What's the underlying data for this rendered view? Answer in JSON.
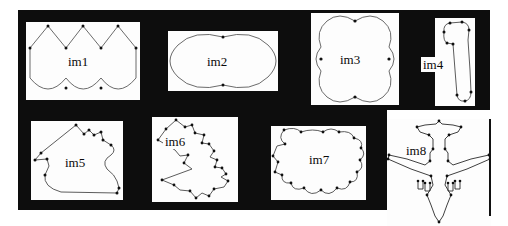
{
  "figure": {
    "kind": "shape-silhouette-grid",
    "background_color": "#ffffff",
    "backdrop_color": "#0d0d0d",
    "panel_color": "#fdfdfd",
    "outline_color": "#4a4a4a",
    "marker_color": "#101010",
    "rows": 2,
    "columns": 4,
    "item_count": 8
  },
  "panels": [
    {
      "id": "im1",
      "label": "im1",
      "shape_name": "three-lobe-scalloped-rectangle",
      "row": 1,
      "column": 1,
      "vertex_count": 10
    },
    {
      "id": "im2",
      "label": "im2",
      "shape_name": "two-lobe-peanut",
      "row": 1,
      "column": 2,
      "vertex_count": 4
    },
    {
      "id": "im3",
      "label": "im3",
      "shape_name": "four-lobe-clover-square",
      "row": 1,
      "column": 3,
      "vertex_count": 8
    },
    {
      "id": "im4",
      "label": "im4",
      "shape_name": "boot-hook-outline",
      "row": 1,
      "column": 4,
      "vertex_count": 11
    },
    {
      "id": "im5",
      "label": "im5",
      "shape_name": "crested-blob-outline",
      "row": 2,
      "column": 1,
      "vertex_count": 14
    },
    {
      "id": "im6",
      "label": "im6",
      "shape_name": "jagged-leaf-outline",
      "row": 2,
      "column": 2,
      "vertex_count": 22
    },
    {
      "id": "im7",
      "label": "im7",
      "shape_name": "cloud-lobed-blob",
      "row": 2,
      "column": 3,
      "vertex_count": 20
    },
    {
      "id": "im8",
      "label": "im8",
      "shape_name": "airplane-silhouette",
      "row": 2,
      "column": 4,
      "vertex_count": 34
    }
  ]
}
